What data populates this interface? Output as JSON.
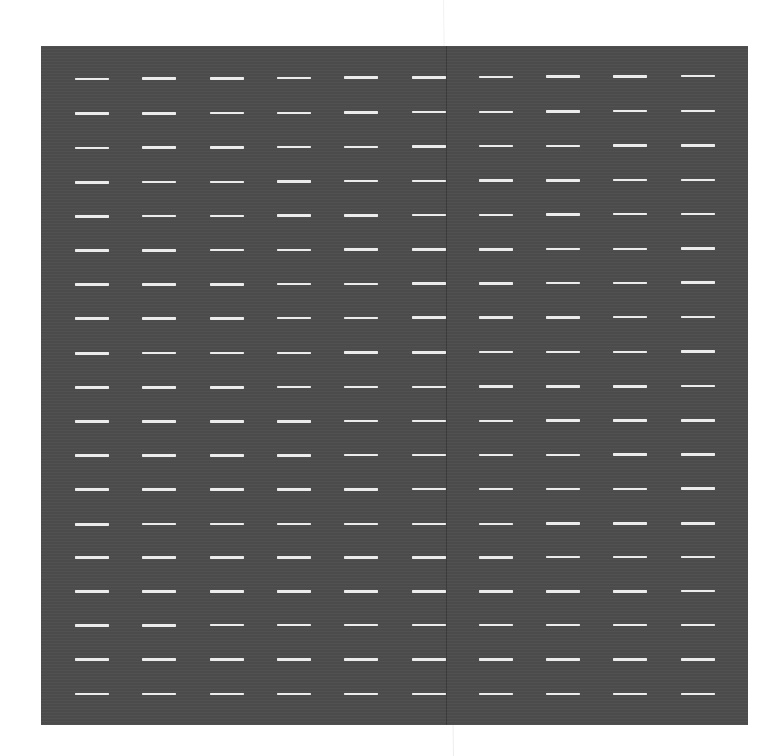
{
  "canvas": {
    "width": 783,
    "height": 756,
    "background": "#ffffff"
  },
  "page_seam": {
    "x_top": 443,
    "x_bottom": 453,
    "color": "#e6e6e6"
  },
  "panel": {
    "x": 41,
    "y": 46,
    "width": 707,
    "height": 679,
    "color": "#4d4d4d",
    "seam_x": 405
  },
  "dash_grid": {
    "columns": 10,
    "rows": 19,
    "dash_width": 34,
    "dash_height": 2.5,
    "dash_color": "#ececec",
    "column_x": [
      75,
      142.3,
      209.6,
      276.9,
      344.2,
      411.5,
      478.8,
      546.1,
      613.4,
      680.7
    ],
    "row_y": [
      79,
      113.7,
      148,
      182.3,
      216.3,
      250.7,
      284.7,
      318.7,
      353.3,
      387.7,
      421.7,
      455.7,
      489.7,
      524.3,
      557.7,
      591.7,
      625.3,
      659.7,
      694
    ],
    "column_rise_top_px": 0.33,
    "column_rise_bottom_px": 0.0
  }
}
